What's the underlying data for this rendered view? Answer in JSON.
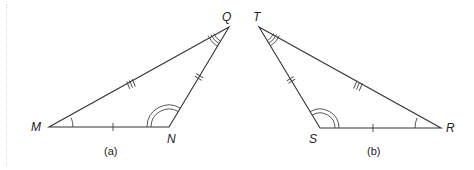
{
  "figure": {
    "triangles": [
      {
        "id": "a",
        "caption": "(a)",
        "vertices": {
          "M": {
            "label": "M",
            "x": 49,
            "y": 127
          },
          "N": {
            "label": "N",
            "x": 169,
            "y": 127
          },
          "Q": {
            "label": "Q",
            "x": 229,
            "y": 27
          }
        },
        "side_marks": {
          "MN": 1,
          "NQ": 2,
          "MQ": 3
        },
        "angle_marks": {
          "M": 1,
          "N": 2,
          "Q": 3
        }
      },
      {
        "id": "b",
        "caption": "(b)",
        "vertices": {
          "T": {
            "label": "T",
            "x": 259,
            "y": 27
          },
          "S": {
            "label": "S",
            "x": 320,
            "y": 128
          },
          "R": {
            "label": "R",
            "x": 441,
            "y": 128
          }
        },
        "side_marks": {
          "SR": 1,
          "TS": 2,
          "TR": 3
        },
        "angle_marks": {
          "R": 1,
          "S": 2,
          "T": 3
        }
      }
    ],
    "labels": {
      "M": "M",
      "N": "N",
      "Q": "Q",
      "T": "T",
      "S": "S",
      "R": "R",
      "caption_a": "(a)",
      "caption_b": "(b)"
    },
    "colors": {
      "stroke": "#333333",
      "background": "#ffffff"
    }
  }
}
